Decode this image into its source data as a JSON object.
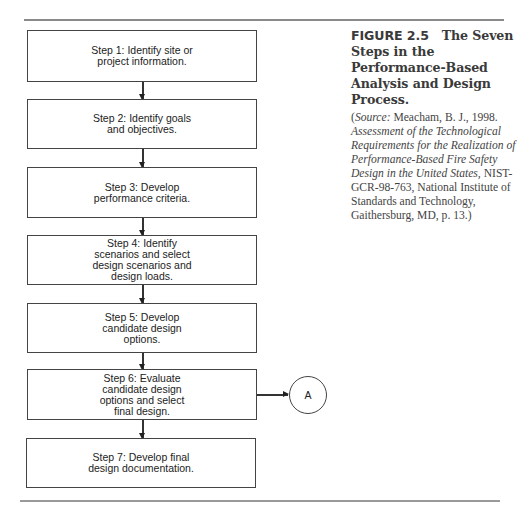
{
  "figure": {
    "label": "FIGURE 2.5",
    "title": "The Seven Steps in the Performance-Based Analysis and Design Process.",
    "source": {
      "prefix": "(",
      "source_label": "Source:",
      "author": " Meacham, B. J., 1998.",
      "work_title": "Assessment of the Technological Requirements for the Realization of Performance-Based Fire Safety Design in the United States,",
      "details": " NIST-GCR-98-763, National Institute of Standards and Technology, Gaithersburg, MD, p. 13.)"
    }
  },
  "flowchart": {
    "steps": [
      {
        "label": "Step 1: Identify site or\nproject information."
      },
      {
        "label": "Step 2: Identify goals\nand objectives."
      },
      {
        "label": "Step 3: Develop\nperformance criteria."
      },
      {
        "label": "Step 4: Identify\nscenarios and select\ndesign scenarios and\ndesign loads."
      },
      {
        "label": "Step 5: Develop\ncandidate design\noptions."
      },
      {
        "label": "Step 6: Evaluate\ncandidate design\noptions and select\nfinal design."
      },
      {
        "label": "Step 7: Develop final\ndesign documentation."
      }
    ],
    "connector": {
      "label": "A",
      "from_step": 6
    }
  }
}
